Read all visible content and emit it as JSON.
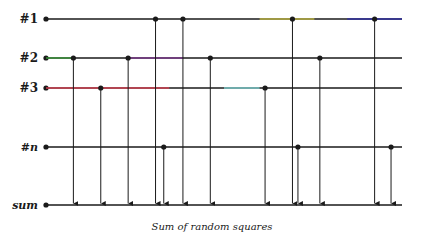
{
  "diagram": {
    "caption": "Sum of random squares",
    "rows": [
      {
        "id": "row1",
        "label": "#1",
        "italic": false
      },
      {
        "id": "row2",
        "label": "#2",
        "italic": false
      },
      {
        "id": "row3",
        "label": "#3",
        "italic": false
      },
      {
        "id": "rown",
        "label": "#n",
        "italic": true
      },
      {
        "id": "sum",
        "label": "sum",
        "italic": true
      }
    ],
    "taps": {
      "row1": [
        4,
        5,
        9,
        12
      ],
      "row2": [
        1,
        3,
        6,
        10
      ],
      "row3": [
        2,
        8
      ],
      "rown": [
        4.3,
        9.2,
        12.6
      ]
    },
    "tap_scale": {
      "min": 0,
      "max": 13
    },
    "highlights": [
      {
        "row": "row2",
        "from": 0,
        "to": 1,
        "color": "#3a9a3a"
      },
      {
        "row": "row2",
        "from": 3,
        "to": 5,
        "color": "#7a3a8a"
      },
      {
        "row": "row3",
        "from": 0,
        "to": 4.5,
        "color": "#d04050"
      },
      {
        "row": "row3",
        "from": 6.5,
        "to": 7.8,
        "color": "#7ac8c8"
      },
      {
        "row": "row1",
        "from": 7.8,
        "to": 9.8,
        "color": "#b8b040"
      },
      {
        "row": "row1",
        "from": 11,
        "to": 13,
        "color": "#3030a0"
      }
    ],
    "line_color": "#1a1a1a"
  }
}
